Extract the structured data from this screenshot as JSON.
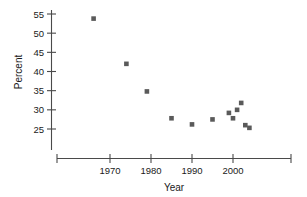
{
  "chart_data": {
    "type": "scatter",
    "title": "",
    "xlabel": "Year",
    "ylabel": "Percent",
    "xlim": [
      1961,
      2005.5
    ],
    "ylim": [
      21,
      56.5
    ],
    "grid": false,
    "legend": null,
    "x_ticks": [
      1970,
      1980,
      1990,
      2000
    ],
    "x_tick_labels": [
      "1970",
      "1980",
      "1990",
      "2000"
    ],
    "y_ticks": [
      25,
      30,
      35,
      40,
      45,
      50,
      55
    ],
    "y_tick_labels": [
      "25",
      "30",
      "35",
      "40",
      "45",
      "50",
      "55"
    ],
    "marker": "square",
    "marker_color": "#5a5a5a",
    "x": [
      1966,
      1974,
      1979,
      1985,
      1990,
      1995,
      1999,
      2000,
      2001,
      2002,
      2003,
      2004
    ],
    "y": [
      53.8,
      42.0,
      34.8,
      27.8,
      26.2,
      27.5,
      29.2,
      27.8,
      30.0,
      31.8,
      26.0,
      25.3
    ],
    "points": [
      {
        "x": 1966,
        "y": 53.8
      },
      {
        "x": 1974,
        "y": 42.0
      },
      {
        "x": 1979,
        "y": 34.8
      },
      {
        "x": 1985,
        "y": 27.8
      },
      {
        "x": 1990,
        "y": 26.2
      },
      {
        "x": 1995,
        "y": 27.5
      },
      {
        "x": 1999,
        "y": 29.2
      },
      {
        "x": 2000,
        "y": 27.8
      },
      {
        "x": 2001,
        "y": 30.0
      },
      {
        "x": 2002,
        "y": 31.8
      },
      {
        "x": 2003,
        "y": 26.0
      },
      {
        "x": 2004,
        "y": 25.3
      }
    ]
  },
  "axis": {
    "x_title": "Year",
    "y_title": "Percent"
  }
}
